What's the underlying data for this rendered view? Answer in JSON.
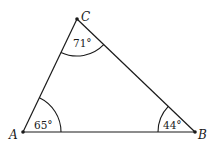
{
  "diagram": {
    "type": "triangle",
    "stroke_color": "#1a1a1a",
    "background": "#ffffff",
    "vertices": [
      {
        "id": "A",
        "label": "A",
        "x": 23,
        "y": 132
      },
      {
        "id": "B",
        "label": "B",
        "x": 195,
        "y": 132
      },
      {
        "id": "C",
        "label": "C",
        "x": 77,
        "y": 19
      }
    ],
    "angles": [
      {
        "vertex": "A",
        "label": "65°"
      },
      {
        "vertex": "B",
        "label": "44°"
      },
      {
        "vertex": "C",
        "label": "71°"
      }
    ]
  }
}
